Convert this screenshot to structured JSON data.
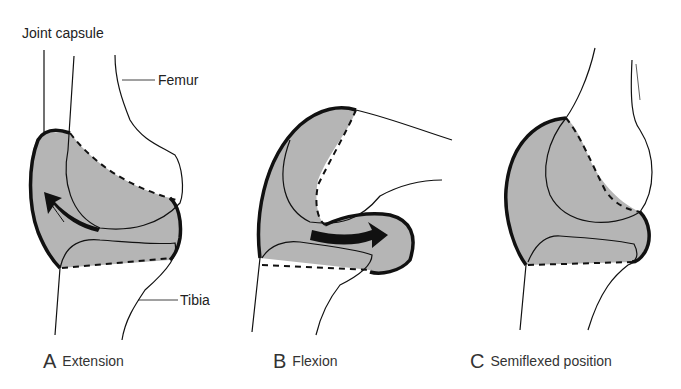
{
  "labels": {
    "joint_capsule": "Joint capsule",
    "femur": "Femur",
    "tibia": "Tibia"
  },
  "panels": [
    {
      "letter": "A",
      "caption": "Extension"
    },
    {
      "letter": "B",
      "caption": "Flexion"
    },
    {
      "letter": "C",
      "caption": "Semiflexed position"
    }
  ],
  "colors": {
    "capsule_fill": "#b5b5b5",
    "line": "#1a1a1a"
  }
}
